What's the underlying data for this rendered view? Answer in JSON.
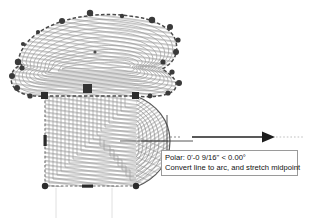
{
  "app": {
    "kind": "cad-drawing-editor",
    "background_color": "#ffffff"
  },
  "drawing": {
    "name": "hatched-t-shaped-polyline",
    "description": "T-shaped hatched polyline with concentric island hatch, selected with grips; right edge of lower stem being stretched into an arc",
    "line_color": "#6b6b6b",
    "hatch_color": "#b9b9b9",
    "grip_color": "#3a3a3a",
    "hot_grip_color": "#2a2a2a",
    "outline": [
      {
        "x": 18,
        "y": 62
      },
      {
        "x": 30,
        "y": 39
      },
      {
        "x": 52,
        "y": 22
      },
      {
        "x": 86,
        "y": 14
      },
      {
        "x": 120,
        "y": 16
      },
      {
        "x": 152,
        "y": 22
      },
      {
        "x": 170,
        "y": 30
      },
      {
        "x": 176,
        "y": 48
      },
      {
        "x": 172,
        "y": 64
      },
      {
        "x": 162,
        "y": 70
      },
      {
        "x": 168,
        "y": 78
      },
      {
        "x": 176,
        "y": 86
      },
      {
        "x": 170,
        "y": 94
      },
      {
        "x": 152,
        "y": 97
      },
      {
        "x": 136,
        "y": 96
      },
      {
        "x": 136,
        "y": 187
      },
      {
        "x": 45,
        "y": 187
      },
      {
        "x": 45,
        "y": 96
      },
      {
        "x": 28,
        "y": 96
      },
      {
        "x": 14,
        "y": 88
      },
      {
        "x": 12,
        "y": 76
      },
      {
        "x": 22,
        "y": 70
      }
    ],
    "grips": [
      {
        "x": 18,
        "y": 62,
        "shape": "circle",
        "state": "warm"
      },
      {
        "x": 23,
        "y": 44,
        "shape": "circle",
        "state": "warm"
      },
      {
        "x": 38,
        "y": 32,
        "shape": "circle",
        "state": "warm"
      },
      {
        "x": 62,
        "y": 21,
        "shape": "circle",
        "state": "warm"
      },
      {
        "x": 90,
        "y": 13,
        "shape": "circle",
        "state": "warm"
      },
      {
        "x": 122,
        "y": 16,
        "shape": "circle",
        "state": "warm"
      },
      {
        "x": 152,
        "y": 20,
        "shape": "circle",
        "state": "warm"
      },
      {
        "x": 170,
        "y": 27,
        "shape": "circle",
        "state": "warm"
      },
      {
        "x": 178,
        "y": 40,
        "shape": "circle",
        "state": "warm"
      },
      {
        "x": 176,
        "y": 52,
        "shape": "circle",
        "state": "warm"
      },
      {
        "x": 163,
        "y": 62,
        "shape": "circle",
        "state": "warm"
      },
      {
        "x": 172,
        "y": 72,
        "shape": "circle",
        "state": "warm"
      },
      {
        "x": 179,
        "y": 83,
        "shape": "circle",
        "state": "warm"
      },
      {
        "x": 168,
        "y": 93,
        "shape": "circle",
        "state": "warm"
      },
      {
        "x": 150,
        "y": 96,
        "shape": "circle",
        "state": "warm"
      },
      {
        "x": 136,
        "y": 96,
        "shape": "square",
        "state": "warm"
      },
      {
        "x": 136,
        "y": 186,
        "shape": "circle",
        "state": "warm"
      },
      {
        "x": 88,
        "y": 186,
        "shape": "dash",
        "state": "midpoint"
      },
      {
        "x": 45,
        "y": 186,
        "shape": "circle",
        "state": "warm"
      },
      {
        "x": 45,
        "y": 141,
        "shape": "dash-v",
        "state": "midpoint"
      },
      {
        "x": 45,
        "y": 96,
        "shape": "square",
        "state": "warm"
      },
      {
        "x": 30,
        "y": 96,
        "shape": "circle",
        "state": "warm"
      },
      {
        "x": 17,
        "y": 88,
        "shape": "circle",
        "state": "warm"
      },
      {
        "x": 12,
        "y": 76,
        "shape": "circle",
        "state": "warm"
      },
      {
        "x": 22,
        "y": 68,
        "shape": "circle",
        "state": "warm"
      },
      {
        "x": 87,
        "y": 88,
        "shape": "square",
        "state": "hot"
      },
      {
        "x": 95,
        "y": 52,
        "shape": "dot",
        "state": "small"
      }
    ],
    "stretch": {
      "arc_bulge_direction": "right",
      "arc_apex": {
        "x": 167,
        "y": 141
      },
      "rubber_band_from": {
        "x": 136,
        "y": 141
      },
      "rubber_band_to": {
        "x": 168,
        "y": 141
      }
    },
    "cursor": {
      "type": "crosshair",
      "x": 167,
      "y": 141
    },
    "tracking_vector": {
      "label": "polar-tracking-arrow",
      "start_x": 182,
      "end_x": 292,
      "y": 137,
      "arrow": "right"
    }
  },
  "tooltip": {
    "name": "polar-tracking-tooltip",
    "line1": "Polar: 0'-0 9/16\" < 0.00°",
    "line2": "Convert line to arc, and stretch midpoint",
    "border_color": "#9a9a9a",
    "background_color": "#ffffff",
    "text_color": "#111111"
  }
}
